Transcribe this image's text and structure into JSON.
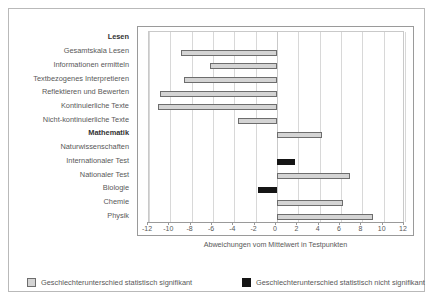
{
  "chart_data": {
    "type": "bar",
    "orientation": "horizontal",
    "title": "",
    "xlabel": "Abweichungen vom Mittelwert in Testpunkten",
    "ylabel": "",
    "xlim": [
      -12,
      12
    ],
    "xticks": [
      -12,
      -10,
      -8,
      -6,
      -4,
      -2,
      0,
      2,
      4,
      6,
      8,
      10,
      12
    ],
    "xticklabels": [
      "-12",
      "-10",
      "-8",
      "-6",
      "-4",
      "-2",
      "0",
      "2",
      "4",
      "6",
      "8",
      "10",
      "12"
    ],
    "grid": true,
    "legend_position": "bottom",
    "categories": [
      "Lesen",
      "Gesamtskala Lesen",
      "Informationen ermitteln",
      "Textbezogenes Interpretieren",
      "Reflektieren und Bewerten",
      "Kontinuierliche Texte",
      "Nicht-kontinuierliche Texte",
      "Mathematik",
      "Naturwissenschaften",
      "Internationaler Test",
      "Nationaler Test",
      "Biologie",
      "Chemie",
      "Physik"
    ],
    "bars": [
      {
        "category": "Lesen",
        "value": null,
        "header": true,
        "significant": null
      },
      {
        "category": "Gesamtskala Lesen",
        "value": -9.0,
        "header": false,
        "significant": true
      },
      {
        "category": "Informationen ermitteln",
        "value": -6.3,
        "header": false,
        "significant": true
      },
      {
        "category": "Textbezogenes Interpretieren",
        "value": -8.7,
        "header": false,
        "significant": true
      },
      {
        "category": "Reflektieren und Bewerten",
        "value": -11.0,
        "header": false,
        "significant": true
      },
      {
        "category": "Kontinuierliche Texte",
        "value": -11.2,
        "header": false,
        "significant": true
      },
      {
        "category": "Nicht-kontinuierliche Texte",
        "value": -3.7,
        "header": false,
        "significant": true
      },
      {
        "category": "Mathematik",
        "value": 4.2,
        "header": true,
        "significant": true
      },
      {
        "category": "Naturwissenschaften",
        "value": null,
        "header": false,
        "significant": null
      },
      {
        "category": "Internationaler Test",
        "value": 1.7,
        "header": false,
        "significant": false
      },
      {
        "category": "Nationaler Test",
        "value": 6.8,
        "header": false,
        "significant": true
      },
      {
        "category": "Biologie",
        "value": -1.8,
        "header": false,
        "significant": false
      },
      {
        "category": "Chemie",
        "value": 6.2,
        "header": false,
        "significant": true
      },
      {
        "category": "Physik",
        "value": 9.0,
        "header": false,
        "significant": true
      }
    ],
    "series": [
      {
        "name": "Geschlechterunterschied statistisch signifikant",
        "color": "#d4d4d4"
      },
      {
        "name": "Geschlechterunterschied statistisch nicht signifikant",
        "color": "#151515"
      }
    ]
  },
  "legend": {
    "items": [
      {
        "label": "Geschlechterunterschied statistisch signifikant",
        "kind": "sig"
      },
      {
        "label": "Geschlechterunterschied statistisch nicht signifikant",
        "kind": "nonsig"
      }
    ]
  },
  "colors": {
    "significant": "#d4d4d4",
    "not_significant": "#151515",
    "bar_border": "#6d6d6d",
    "grid": "#d8d8d8",
    "frame": "#b9b9b9"
  }
}
